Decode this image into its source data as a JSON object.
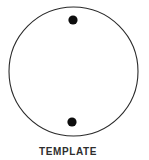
{
  "label": "TEMPLATE",
  "colors": {
    "background": "#ffffff",
    "circle_outline": "#2a2a2a",
    "hole_fill": "#0d0d0d",
    "label_text": "#2e2e2e"
  },
  "diagram": {
    "shape": "circle",
    "holes": [
      {
        "name": "top-hole",
        "position": "top-center-inside"
      },
      {
        "name": "bottom-hole",
        "position": "bottom-center-inside"
      }
    ]
  }
}
